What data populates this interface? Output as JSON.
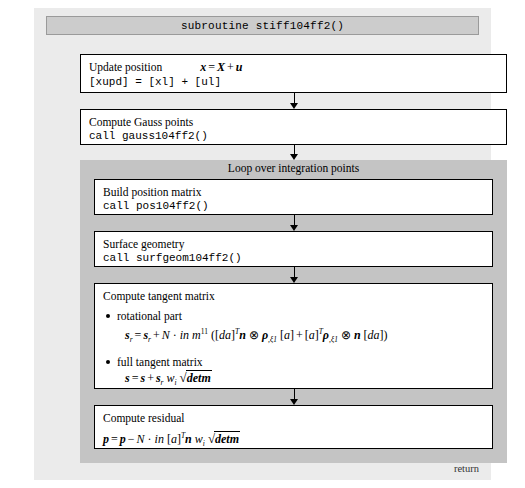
{
  "diagram": {
    "title": "subroutine stiff104ff2()",
    "return_label": "return",
    "colors": {
      "outer_background": "#ebebeb",
      "title_bar": "#cccccc",
      "loop_background": "#c4c4c4",
      "box_background": "#ffffff",
      "border": "#000000"
    },
    "steps": {
      "update_position": {
        "label": "Update position",
        "formula": "x = X + u",
        "code": "[xupd] = [xl] + [ul]"
      },
      "compute_gauss": {
        "label": "Compute Gauss points",
        "code": "call gauss104ff2()"
      },
      "loop": {
        "title": "Loop over integration points",
        "build_position": {
          "label": "Build position matrix",
          "code": "call pos104ff2()"
        },
        "surface_geometry": {
          "label": "Surface geometry",
          "code": "call surfgeom104ff2()"
        },
        "compute_tangent": {
          "label": "Compute tangent matrix",
          "bullets": [
            {
              "label": "rotational part",
              "formula": "s_r = s_r + N · in m^11 ([da]^T n ⊗ ρ,ξ1 [a] + [a]^T ρ,ξ1 ⊗ n [da])"
            },
            {
              "label": "full tangent matrix",
              "formula": "s = s + s_r w_i √detm"
            }
          ]
        },
        "compute_residual": {
          "label": "Compute residual",
          "formula": "p = p − N · in [a]^T n w_i √detm"
        }
      }
    },
    "arrows": [
      {
        "name": "update-to-gauss"
      },
      {
        "name": "gauss-to-loop"
      },
      {
        "name": "position-to-surfgeom"
      },
      {
        "name": "surfgeom-to-tangent"
      },
      {
        "name": "tangent-to-residual"
      }
    ]
  }
}
